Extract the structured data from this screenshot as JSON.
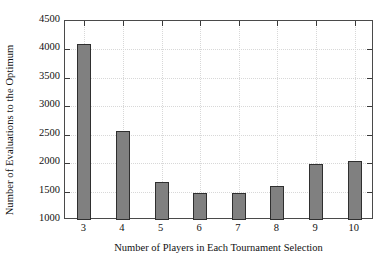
{
  "chart_data": {
    "type": "bar",
    "title": "",
    "xlabel": "Number of Players in Each Tournament Selection",
    "ylabel": "Number of Evaluations to the Optimum",
    "categories": [
      "3",
      "4",
      "5",
      "6",
      "7",
      "8",
      "9",
      "10"
    ],
    "values": [
      4100,
      2560,
      1670,
      1480,
      1470,
      1600,
      1985,
      2030
    ],
    "ylim": [
      1000,
      4500
    ],
    "yticks": [
      "1000",
      "1500",
      "2000",
      "2500",
      "3000",
      "3500",
      "4000",
      "4500"
    ],
    "ytick_values": [
      1000,
      1500,
      2000,
      2500,
      3000,
      3500,
      4000,
      4500
    ],
    "xticks": [
      "3",
      "4",
      "5",
      "6",
      "7",
      "8",
      "9",
      "10"
    ],
    "grid": true,
    "legend": "none",
    "bar_color": "#808080",
    "bar_edge_color": "#2f2f2f",
    "axis_color": "#4a4a4a",
    "grid_color": "#d8d8d8",
    "background": "#ffffff"
  }
}
